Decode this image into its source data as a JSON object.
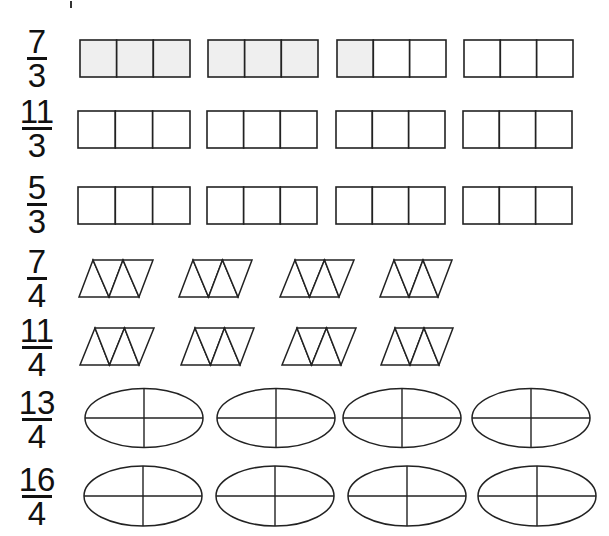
{
  "colors": {
    "stroke": "#222222",
    "shaded": "#efefef",
    "unshaded": "#ffffff",
    "text": "#111111"
  },
  "rows": [
    {
      "id": "row-7-3",
      "fraction": {
        "numerator": "7",
        "denominator": "3",
        "bar_y": 59,
        "bar_width": 20
      },
      "shape": "rectangle-thirds",
      "y": 40,
      "h": 37,
      "shapes": [
        {
          "x": 80,
          "w": 110,
          "shaded_parts": 3
        },
        {
          "x": 208,
          "w": 110,
          "shaded_parts": 3
        },
        {
          "x": 337,
          "w": 109,
          "shaded_parts": 1
        },
        {
          "x": 464,
          "w": 109,
          "shaded_parts": 0
        }
      ]
    },
    {
      "id": "row-11-3",
      "fraction": {
        "numerator": "11",
        "denominator": "3",
        "bar_y": 129,
        "bar_width": 30
      },
      "shape": "rectangle-thirds",
      "y": 111,
      "h": 37,
      "shapes": [
        {
          "x": 78,
          "w": 112,
          "shaded_parts": 0
        },
        {
          "x": 207,
          "w": 110,
          "shaded_parts": 0
        },
        {
          "x": 336,
          "w": 109,
          "shaded_parts": 0
        },
        {
          "x": 463,
          "w": 109,
          "shaded_parts": 0
        }
      ]
    },
    {
      "id": "row-5-3",
      "fraction": {
        "numerator": "5",
        "denominator": "3",
        "bar_y": 205,
        "bar_width": 20
      },
      "shape": "rectangle-thirds",
      "y": 187,
      "h": 37,
      "shapes": [
        {
          "x": 78,
          "w": 112,
          "shaded_parts": 0
        },
        {
          "x": 207,
          "w": 110,
          "shaded_parts": 0
        },
        {
          "x": 336,
          "w": 109,
          "shaded_parts": 0
        },
        {
          "x": 463,
          "w": 109,
          "shaded_parts": 0
        }
      ]
    },
    {
      "id": "row-7-4",
      "fraction": {
        "numerator": "7",
        "denominator": "4",
        "bar_y": 279,
        "bar_width": 20
      },
      "shape": "parallelogram-triangles",
      "y": 260,
      "h": 37,
      "shapes": [
        {
          "top_x": 93,
          "bottom_x": 79,
          "w": 60,
          "shaded_parts": 0
        },
        {
          "top_x": 193,
          "bottom_x": 179,
          "w": 59,
          "shaded_parts": 0
        },
        {
          "top_x": 295,
          "bottom_x": 280,
          "w": 59,
          "shaded_parts": 0
        },
        {
          "top_x": 394,
          "bottom_x": 380,
          "w": 58,
          "shaded_parts": 0
        }
      ]
    },
    {
      "id": "row-11-4",
      "fraction": {
        "numerator": "11",
        "denominator": "4",
        "bar_y": 348,
        "bar_width": 30
      },
      "shape": "parallelogram-triangles",
      "y": 328,
      "h": 37,
      "shapes": [
        {
          "top_x": 95,
          "bottom_x": 80,
          "w": 59,
          "shaded_parts": 0
        },
        {
          "top_x": 195,
          "bottom_x": 181,
          "w": 59,
          "shaded_parts": 0
        },
        {
          "top_x": 297,
          "bottom_x": 282,
          "w": 59,
          "shaded_parts": 0
        },
        {
          "top_x": 395,
          "bottom_x": 381,
          "w": 58,
          "shaded_parts": 0
        }
      ]
    },
    {
      "id": "row-13-4",
      "fraction": {
        "numerator": "13",
        "denominator": "4",
        "bar_y": 420,
        "bar_width": 30
      },
      "shape": "ellipse-quarters",
      "cy": 418,
      "ry": 29.5,
      "shapes": [
        {
          "cx": 144,
          "rx": 59,
          "shaded_parts": 0
        },
        {
          "cx": 276,
          "rx": 59,
          "shaded_parts": 0
        },
        {
          "cx": 402,
          "rx": 59,
          "shaded_parts": 0
        },
        {
          "cx": 531,
          "rx": 59,
          "shaded_parts": 0
        }
      ]
    },
    {
      "id": "row-16-4",
      "fraction": {
        "numerator": "16",
        "denominator": "4",
        "bar_y": 497,
        "bar_width": 30
      },
      "shape": "ellipse-quarters",
      "cy": 496,
      "ry": 30,
      "shapes": [
        {
          "cx": 143,
          "rx": 59,
          "shaded_parts": 0
        },
        {
          "cx": 275,
          "rx": 59,
          "shaded_parts": 0
        },
        {
          "cx": 407,
          "rx": 59,
          "shaded_parts": 0
        },
        {
          "cx": 537,
          "rx": 59,
          "shaded_parts": 0
        }
      ]
    }
  ]
}
